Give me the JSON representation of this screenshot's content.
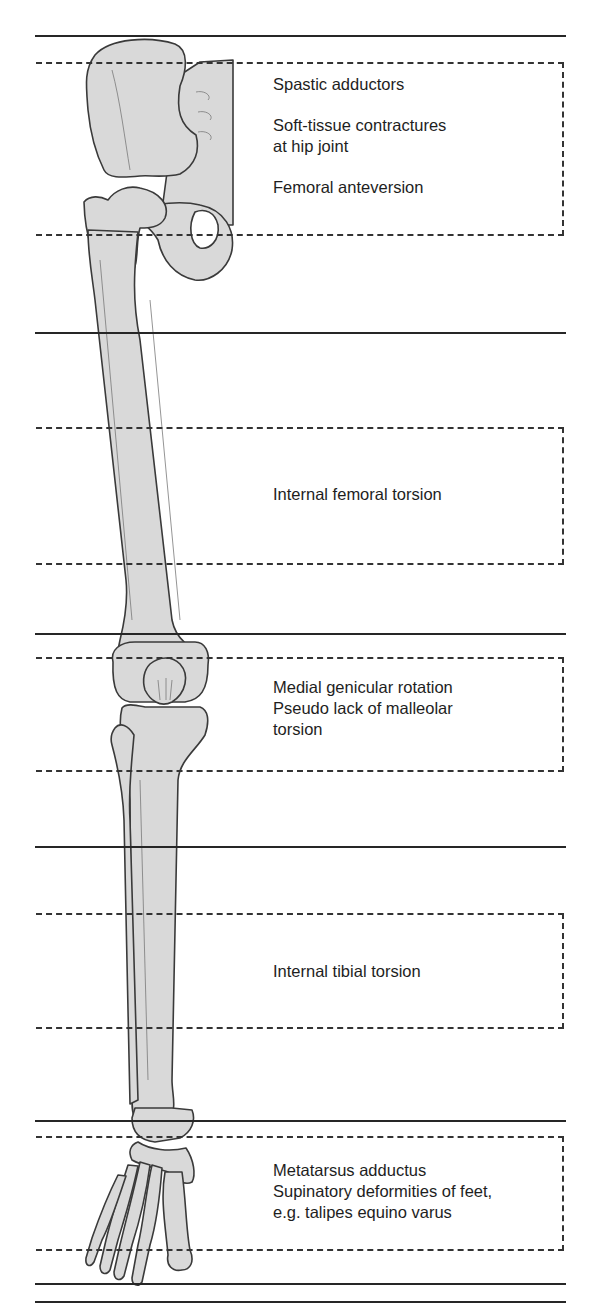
{
  "figure": {
    "type": "anatomical-diagram",
    "bone_fill": "#d9d9d9",
    "line_color": "#262626"
  },
  "levels": [
    {
      "region": "hip",
      "labels": [
        "Spastic adductors",
        "Soft-tissue contractures",
        "at hip joint",
        "Femoral anteversion"
      ]
    },
    {
      "region": "femur",
      "labels": [
        "Internal femoral torsion"
      ]
    },
    {
      "region": "knee",
      "labels": [
        "Medial genicular rotation",
        "Pseudo lack of malleolar",
        "torsion"
      ]
    },
    {
      "region": "tibia",
      "labels": [
        "Internal tibial torsion"
      ]
    },
    {
      "region": "foot",
      "labels": [
        "Metatarsus adductus",
        "Supinatory deformities of feet,",
        "e.g. talipes equino varus"
      ]
    }
  ]
}
